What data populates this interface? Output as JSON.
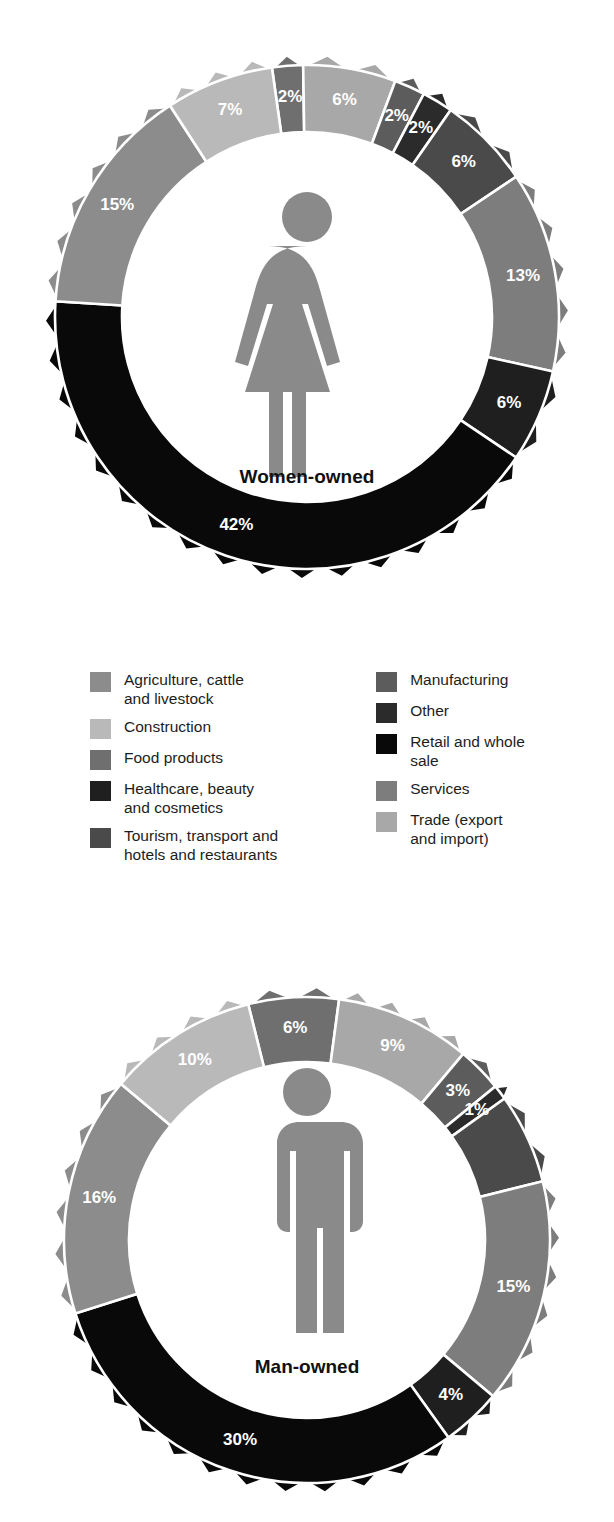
{
  "palette": {
    "agriculture": "#8c8c8c",
    "construction": "#b9b9b9",
    "food_products": "#6f6f6f",
    "healthcare": "#1f1f1f",
    "tourism": "#4a4a4a",
    "manufacturing": "#5c5c5c",
    "other": "#2b2b2b",
    "retail": "#090909",
    "services": "#7d7d7d",
    "trade": "#a8a8a8",
    "figure_icon": "#8a8a8a",
    "slice_label_color": "#ffffff",
    "caption_color": "#111111",
    "background": "#ffffff"
  },
  "legend": {
    "columns": [
      {
        "items": [
          {
            "label": "Agriculture, cattle\nand livestock",
            "color_key": "agriculture",
            "swatch_name": "legend-swatch-agriculture"
          },
          {
            "label": "Construction",
            "color_key": "construction",
            "swatch_name": "legend-swatch-construction"
          },
          {
            "label": "Food products",
            "color_key": "food_products",
            "swatch_name": "legend-swatch-food-products"
          },
          {
            "label": "Healthcare, beauty\nand cosmetics",
            "color_key": "healthcare",
            "swatch_name": "legend-swatch-healthcare"
          },
          {
            "label": "Tourism, transport and\nhotels and restaurants",
            "color_key": "tourism",
            "swatch_name": "legend-swatch-tourism"
          }
        ]
      },
      {
        "items": [
          {
            "label": "Manufacturing",
            "color_key": "manufacturing",
            "swatch_name": "legend-swatch-manufacturing"
          },
          {
            "label": "Other",
            "color_key": "other",
            "swatch_name": "legend-swatch-other"
          },
          {
            "label": "Retail and whole\nsale",
            "color_key": "retail",
            "swatch_name": "legend-swatch-retail"
          },
          {
            "label": "Services",
            "color_key": "services",
            "swatch_name": "legend-swatch-services"
          },
          {
            "label": "Trade (export\nand import)",
            "color_key": "trade",
            "swatch_name": "legend-swatch-trade"
          }
        ]
      }
    ]
  },
  "chart_data": [
    {
      "id": "women",
      "type": "pie",
      "title": "Women-owned",
      "center_caption": "Women-owned",
      "icon": "female-figure-icon",
      "legend_position": "between-charts",
      "categories": [
        "Agriculture, cattle and livestock",
        "Construction",
        "Food products",
        "Manufacturing",
        "Other",
        "Services",
        "Tourism, transport and hotels and restaurants",
        "Healthcare, beauty and cosmetics",
        "Retail and whole sale",
        "Trade (export and import)"
      ],
      "slices": [
        {
          "category": "Food products",
          "value": 2,
          "label": "2%",
          "color_key": "food_products"
        },
        {
          "category": "Trade (export and import)",
          "value": 6,
          "label": "6%",
          "color_key": "trade"
        },
        {
          "category": "Manufacturing",
          "value": 2,
          "label": "2%",
          "color_key": "manufacturing"
        },
        {
          "category": "Other",
          "value": 2,
          "label": "2%",
          "color_key": "other"
        },
        {
          "category": "Tourism, transport and hotels and restaurants",
          "value": 6,
          "label": "6%",
          "color_key": "tourism"
        },
        {
          "category": "Services",
          "value": 13,
          "label": "13%",
          "color_key": "services"
        },
        {
          "category": "Healthcare, beauty and cosmetics",
          "value": 6,
          "label": "6%",
          "color_key": "healthcare"
        },
        {
          "category": "Retail and whole sale",
          "value": 42,
          "label": "42%",
          "color_key": "retail"
        },
        {
          "category": "Agriculture, cattle and livestock",
          "value": 15,
          "label": "15%",
          "color_key": "agriculture"
        },
        {
          "category": "Construction",
          "value": 7,
          "label": "7%",
          "color_key": "construction"
        }
      ]
    },
    {
      "id": "men",
      "type": "pie",
      "title": "Man-owned",
      "center_caption": "Man-owned",
      "icon": "male-figure-icon",
      "legend_position": "between-charts",
      "categories": [
        "Agriculture, cattle and livestock",
        "Construction",
        "Food products",
        "Manufacturing",
        "Other",
        "Services",
        "Tourism, transport and hotels and restaurants",
        "Healthcare, beauty and cosmetics",
        "Retail and whole sale",
        "Trade (export and import)"
      ],
      "slices": [
        {
          "category": "Food products",
          "value": 6,
          "label": "6%",
          "color_key": "food_products"
        },
        {
          "category": "Trade (export and import)",
          "value": 9,
          "label": "9%",
          "color_key": "trade"
        },
        {
          "category": "Manufacturing",
          "value": 3,
          "label": "3%",
          "color_key": "manufacturing"
        },
        {
          "category": "Other",
          "value": 1,
          "label": "1%",
          "color_key": "other"
        },
        {
          "category": "Tourism, transport and hotels and restaurants",
          "value": 6,
          "label": "",
          "color_key": "tourism"
        },
        {
          "category": "Services",
          "value": 15,
          "label": "15%",
          "color_key": "services"
        },
        {
          "category": "Healthcare, beauty and cosmetics",
          "value": 4,
          "label": "4%",
          "color_key": "healthcare"
        },
        {
          "category": "Retail and whole sale",
          "value": 30,
          "label": "30%",
          "color_key": "retail"
        },
        {
          "category": "Agriculture, cattle and livestock",
          "value": 16,
          "label": "16%",
          "color_key": "agriculture"
        },
        {
          "category": "Construction",
          "value": 10,
          "label": "10%",
          "color_key": "construction"
        }
      ]
    }
  ]
}
